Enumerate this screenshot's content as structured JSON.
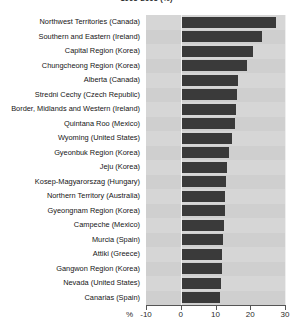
{
  "title": "1995-2005 (%)",
  "axis": {
    "unit_label": "%",
    "ticks": [
      -10,
      0,
      10,
      20,
      30
    ],
    "tick_labels": [
      "-10",
      "0",
      "10",
      "20",
      "30"
    ],
    "xmin": -10,
    "xmax": 30
  },
  "colors": {
    "bar": "#3a3a3a",
    "plot_background": "#d2d2d2",
    "gridline": "#eeeeee",
    "axis": "#555555"
  },
  "chart_data": {
    "type": "bar",
    "orientation": "horizontal",
    "title": "1995-2005 (%)",
    "xlabel": "%",
    "ylabel": "",
    "xlim": [
      -10,
      30
    ],
    "grid": true,
    "legend": null,
    "categories": [
      "Northwest Territories (Canada)",
      "Southern and Eastern (Ireland)",
      "Capital Region (Korea)",
      "Chungcheong Region (Korea)",
      "Alberta (Canada)",
      "Stredni Cechy (Czech Republic)",
      "Border, Midlands and Western (Ireland)",
      "Quintana Roo (Mexico)",
      "Wyoming (United States)",
      "Gyeonbuk Region (Korea)",
      "Jeju (Korea)",
      "Kosep-Magyarorszag (Hungary)",
      "Northern Territory (Australia)",
      "Gyeongnam Region (Korea)",
      "Campeche (Mexico)",
      "Murcia (Spain)",
      "Attiki (Greece)",
      "Gangwon Region (Korea)",
      "Nevada (United States)",
      "Canarias  (Spain)"
    ],
    "values": [
      27.5,
      23.5,
      20.8,
      19.0,
      16.5,
      16.3,
      15.8,
      15.5,
      14.8,
      14.0,
      13.2,
      12.9,
      12.7,
      12.6,
      12.4,
      12.2,
      12.0,
      11.8,
      11.5,
      11.2
    ],
    "ylabel_side": "left"
  }
}
